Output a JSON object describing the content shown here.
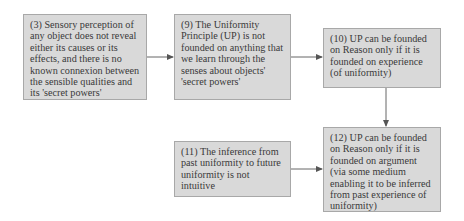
{
  "diagram": {
    "nodes": [
      {
        "id": "3",
        "text": "(3)  Sensory perception of any object does not reveal either its causes or its effects, and there is no known connexion between the sensible qualities and its 'secret powers'"
      },
      {
        "id": "9",
        "text": "(9)  The Uniformity Principle (UP) is not founded on anything that we learn through the senses about objects' 'secret powers'"
      },
      {
        "id": "10",
        "text": "(10)  UP can be founded on Reason only if it is founded on experience (of uniformity)"
      },
      {
        "id": "11",
        "text": "(11)  The inference from past uniformity to future uniformity is not intuitive"
      },
      {
        "id": "12",
        "text": "(12)  UP can be founded on Reason only if it is founded on argument (via some medium enabling it to be inferred from past experience of uniformity)"
      }
    ],
    "edges": [
      {
        "from": "3",
        "to": "9"
      },
      {
        "from": "9",
        "to": "10"
      },
      {
        "from": "10",
        "to": "12"
      },
      {
        "from": "11",
        "to": "12"
      }
    ],
    "colors": {
      "box_fill": "#d9d9d9",
      "box_border": "#a8a8a8",
      "arrow": "#555555",
      "text": "#3a3a3a"
    }
  }
}
